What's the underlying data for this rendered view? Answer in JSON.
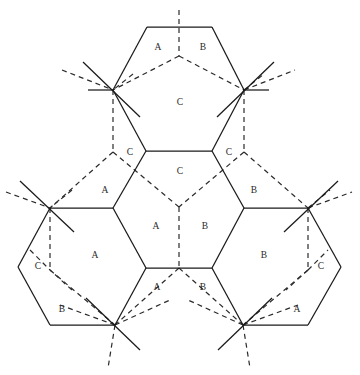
{
  "figure": {
    "kind": "geometric-diagram",
    "width": 360,
    "height": 375,
    "background_color": "#ffffff",
    "solid_line_color": "#1a1a1a",
    "dashed_line_color": "#2b2b2b",
    "label_color": "#2a2a2a"
  },
  "labels": [
    {
      "text": "A",
      "x": 158,
      "y": 48
    },
    {
      "text": "B",
      "x": 203,
      "y": 48
    },
    {
      "text": "C",
      "x": 180,
      "y": 103
    },
    {
      "text": "C",
      "x": 130,
      "y": 153
    },
    {
      "text": "C",
      "x": 229,
      "y": 153
    },
    {
      "text": "C",
      "x": 180,
      "y": 172
    },
    {
      "text": "A",
      "x": 105,
      "y": 191
    },
    {
      "text": "B",
      "x": 254,
      "y": 191
    },
    {
      "text": "A",
      "x": 156,
      "y": 227
    },
    {
      "text": "B",
      "x": 205,
      "y": 227
    },
    {
      "text": "A",
      "x": 95,
      "y": 256
    },
    {
      "text": "B",
      "x": 264,
      "y": 256
    },
    {
      "text": "C",
      "x": 38,
      "y": 267
    },
    {
      "text": "C",
      "x": 321,
      "y": 267
    },
    {
      "text": "A",
      "x": 157,
      "y": 288
    },
    {
      "text": "B",
      "x": 203,
      "y": 288
    },
    {
      "text": "B",
      "x": 62,
      "y": 310
    },
    {
      "text": "A",
      "x": 297,
      "y": 310
    }
  ],
  "solid_paths": [
    "M 147 27 L 212 27",
    "M 147 27 L 113 90",
    "M 212 27 L 244 90",
    "M 113 90 L 146 151",
    "M 244 90 L 212 151",
    "M 146 151 L 212 151",
    "M 146 151 L 113 208",
    "M 212 151 L 244 208",
    "M 113 208 L 50 208",
    "M 244 208 L 308 208",
    "M 113 208 L 146 268",
    "M 244 208 L 212 268",
    "M 146 268 L 212 268",
    "M 146 268 L 115 325",
    "M 212 268 L 243 325",
    "M 50 208 L 18 267",
    "M 18 267 L 50 325",
    "M 50 325 L 115 325",
    "M 308 208 L 341 267",
    "M 341 267 L 308 325",
    "M 308 325 L 243 325",
    "M 83 62 L 140 117",
    "M 217 117 L 274 62",
    "M 88 90 L 113 90",
    "M 244 90 L 269 90",
    "M 20 181 L 74 232",
    "M 284 232 L 338 181",
    "M 86 298 L 140 350",
    "M 218 350 L 272 298"
  ],
  "dashed_paths": [
    "M 179 10 L 179 56",
    "M 179 56 L 113 90",
    "M 179 56 L 244 90",
    "M 113 90 L 113 152",
    "M 244 90 L 244 152",
    "M 113 152 L 50 208",
    "M 244 152 L 308 208",
    "M 113 152 L 179 207",
    "M 244 152 L 179 207",
    "M 179 207 L 179 268",
    "M 179 268 L 115 325",
    "M 179 268 L 243 325",
    "M 50 208 L 50 270",
    "M 308 208 L 308 270",
    "M 50 270 L 115 325",
    "M 308 270 L 243 325",
    "M 62 70 L 113 90",
    "M 244 90 L 295 70",
    "M 133 74 L 113 90",
    "M 244 90 L 264 74",
    "M 6 192 L 50 208",
    "M 308 208 L 352 192",
    "M 72 190 L 50 208",
    "M 308 208 L 330 190",
    "M 30 250 L 50 270",
    "M 308 270 L 328 250",
    "M 72 290 L 50 270",
    "M 308 270 L 286 290",
    "M 115 325 L 170 300",
    "M 243 325 L 188 300",
    "M 115 325 L 60 305",
    "M 243 325 L 298 305",
    "M 115 325 L 108 368",
    "M 243 325 L 250 368"
  ]
}
